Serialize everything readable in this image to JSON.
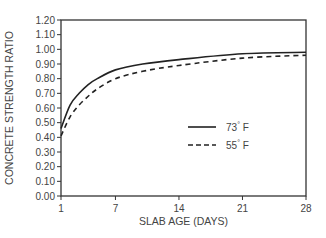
{
  "chart_data": {
    "type": "line",
    "title": "",
    "xlabel": "SLAB AGE (DAYS)",
    "ylabel": "CONCRETE  STRENGTH  RATIO",
    "xlim": [
      1,
      28
    ],
    "ylim": [
      0.0,
      1.2
    ],
    "x_ticks": [
      1,
      7,
      14,
      21,
      28
    ],
    "x_tick_labels": [
      "1",
      "7",
      "14",
      "21",
      "28"
    ],
    "y_ticks": [
      0.0,
      0.1,
      0.2,
      0.3,
      0.4,
      0.5,
      0.6,
      0.7,
      0.8,
      0.9,
      1.0,
      1.1,
      1.2
    ],
    "y_tick_labels": [
      "0.00",
      "0.10",
      "0.20",
      "0.30",
      "0.40",
      "0.50",
      "0.60",
      "0.70",
      "0.80",
      "0.90",
      "1.00",
      "1.10",
      "1.20"
    ],
    "grid": false,
    "legend_position": "inside-center-right",
    "x": [
      1,
      2,
      3,
      4,
      5,
      7,
      10,
      14,
      21,
      28
    ],
    "series": [
      {
        "name": "73° F",
        "style": "solid",
        "color": "#222222",
        "values": [
          0.46,
          0.62,
          0.7,
          0.76,
          0.8,
          0.86,
          0.9,
          0.93,
          0.97,
          0.98
        ]
      },
      {
        "name": "55° F",
        "style": "dashed",
        "color": "#222222",
        "values": [
          0.41,
          0.54,
          0.62,
          0.68,
          0.73,
          0.8,
          0.85,
          0.89,
          0.94,
          0.96
        ]
      }
    ]
  },
  "legend": {
    "items": [
      {
        "label": "73",
        "unit": "F",
        "degree": "°",
        "style": "solid"
      },
      {
        "label": "55",
        "unit": "F",
        "degree": "°",
        "style": "dashed"
      }
    ]
  }
}
